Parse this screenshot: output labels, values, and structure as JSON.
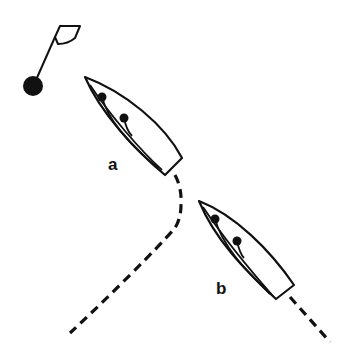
{
  "diagram": {
    "type": "sailing-rules",
    "elements": {
      "mark": {
        "kind": "buoy-with-flag",
        "color": "#111111"
      },
      "boats": [
        {
          "id": "a",
          "label": "a"
        },
        {
          "id": "b",
          "label": "b"
        }
      ],
      "tracks": [
        {
          "boat": "a",
          "style": "dashed"
        },
        {
          "boat": "b",
          "style": "dashed"
        }
      ]
    }
  }
}
